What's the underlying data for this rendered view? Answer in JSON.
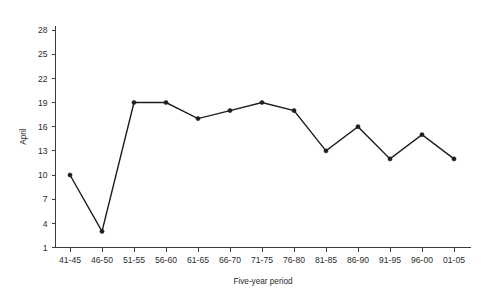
{
  "chart_data": {
    "type": "line",
    "title": "",
    "subtitle": "",
    "xlabel": "Five-year period",
    "ylabel": "April",
    "categories": [
      "41-45",
      "46-50",
      "51-55",
      "56-60",
      "61-65",
      "66-70",
      "71-75",
      "76-80",
      "81-85",
      "86-90",
      "91-95",
      "96-00",
      "01-05"
    ],
    "values": [
      10,
      3,
      19,
      19,
      17,
      18,
      19,
      18,
      13,
      16,
      12,
      15,
      12
    ],
    "series": [
      {
        "name": "April",
        "values": [
          10,
          3,
          19,
          19,
          17,
          18,
          19,
          18,
          13,
          16,
          12,
          15,
          12
        ]
      }
    ],
    "ylim": [
      1,
      28
    ],
    "yticks": [
      1,
      4,
      7,
      10,
      13,
      16,
      19,
      22,
      25,
      28
    ],
    "ytick_labels": [
      "1",
      "4",
      "7",
      "10",
      "13",
      "16",
      "19",
      "22",
      "25",
      "28"
    ],
    "xtick_labels": [
      "41-45",
      "46-50",
      "51-55",
      "56-60",
      "61-65",
      "66-70",
      "71-75",
      "76-80",
      "81-85",
      "86-90",
      "91-95",
      "96-00",
      "01-05"
    ],
    "grid": false,
    "legend": false,
    "legend_position": "none",
    "marker": "filled-circle",
    "line_color": "#1c1c1c",
    "axis_color": "#3b3b3b",
    "background_color": "#ffffff",
    "annotations": []
  }
}
